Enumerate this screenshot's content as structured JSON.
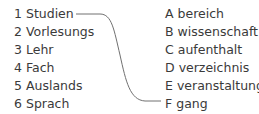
{
  "exercise": {
    "left_items": [
      {
        "key": "1",
        "word": "Studien"
      },
      {
        "key": "2",
        "word": "Vorlesungs"
      },
      {
        "key": "3",
        "word": "Lehr"
      },
      {
        "key": "4",
        "word": "Fach"
      },
      {
        "key": "5",
        "word": "Auslands"
      },
      {
        "key": "6",
        "word": "Sprach"
      }
    ],
    "right_items": [
      {
        "key": "A",
        "word": "bereich"
      },
      {
        "key": "B",
        "word": "wissenschaft"
      },
      {
        "key": "C",
        "word": "aufenthalt"
      },
      {
        "key": "D",
        "word": "verzeichnis"
      },
      {
        "key": "E",
        "word": "veranstaltung"
      },
      {
        "key": "F",
        "word": "gang"
      }
    ],
    "example_match": {
      "from": "1",
      "to": "F"
    },
    "line_color": "#707070"
  }
}
